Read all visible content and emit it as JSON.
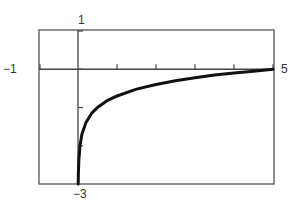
{
  "chart_data": {
    "type": "line",
    "title": "",
    "xlabel": "",
    "ylabel": "",
    "xlim": [
      -1,
      5
    ],
    "ylim": [
      -3,
      1
    ],
    "grid": false,
    "legend": null,
    "x_ticks": [
      1,
      2,
      3,
      4,
      5
    ],
    "y_ticks": [
      -2,
      -1,
      0,
      1
    ],
    "window_labels": {
      "xmin": "−1",
      "xmax": "5",
      "ymax": "1",
      "ymin": "−3"
    },
    "series": [
      {
        "name": "y = log(x) − log 5",
        "x": [
          0.005,
          0.01,
          0.02,
          0.05,
          0.1,
          0.2,
          0.35,
          0.5,
          0.75,
          1,
          1.5,
          2,
          2.5,
          3,
          3.5,
          4,
          4.5,
          5
        ],
        "y": [
          -3.0,
          -2.7,
          -2.4,
          -2.0,
          -1.7,
          -1.4,
          -1.15,
          -1.0,
          -0.82,
          -0.7,
          -0.52,
          -0.4,
          -0.3,
          -0.22,
          -0.15,
          -0.1,
          -0.05,
          0.0
        ]
      }
    ],
    "colors": {
      "curve": "#111111",
      "axes": "#444444",
      "frame": "#555555"
    }
  }
}
